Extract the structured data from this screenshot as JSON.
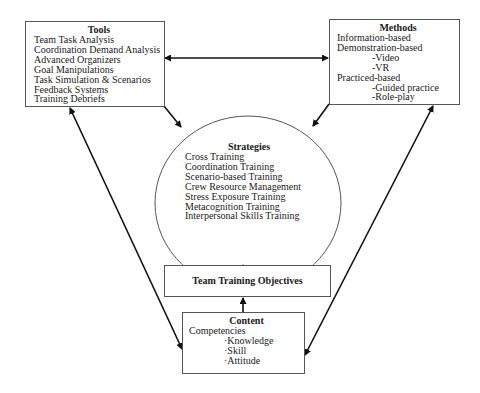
{
  "tools": {
    "title": "Tools",
    "items": [
      "Team Task Analysis",
      "Coordination Demand Analysis",
      "Advanced Organizers",
      "Goal Manipulations",
      "Task Simulation & Scenarios",
      "Feedback Systems",
      "Training Debriefs"
    ]
  },
  "methods": {
    "title": "Methods",
    "items": [
      {
        "text": "Information-based",
        "level": 0
      },
      {
        "text": "Demonstration-based",
        "level": 0
      },
      {
        "text": "-Video",
        "level": 1
      },
      {
        "text": "-VR",
        "level": 1
      },
      {
        "text": "Practiced-based",
        "level": 0
      },
      {
        "text": "-Guided practice",
        "level": 1
      },
      {
        "text": "-Role-play",
        "level": 1
      }
    ]
  },
  "strategies": {
    "title": "Strategies",
    "items": [
      "Cross Training",
      "Coordination Training",
      "Scenario-based Training",
      "Crew Resource Management",
      "Stress Exposure Training",
      "Metacognition Training",
      "Interpersonal Skills Training"
    ]
  },
  "objectives": {
    "title": "Team Training Objectives"
  },
  "content": {
    "title": "Content",
    "heading": "Competencies",
    "items": [
      "·Knowledge",
      "·Skill",
      "·Attitude"
    ]
  },
  "connections": [
    {
      "from": "tools",
      "to": "methods",
      "type": "bidirectional"
    },
    {
      "from": "tools",
      "to": "strategies",
      "type": "directed"
    },
    {
      "from": "methods",
      "to": "strategies",
      "type": "directed"
    },
    {
      "from": "objectives",
      "to": "strategies",
      "type": "directed"
    },
    {
      "from": "content",
      "to": "objectives",
      "type": "directed"
    },
    {
      "from": "tools",
      "to": "content",
      "type": "bidirectional"
    },
    {
      "from": "methods",
      "to": "content",
      "type": "bidirectional"
    }
  ]
}
